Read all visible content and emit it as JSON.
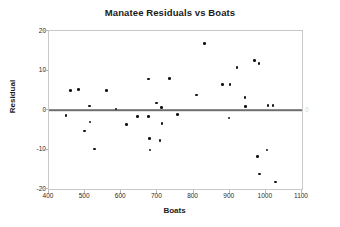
{
  "chart_data": {
    "type": "scatter",
    "title": "Manatee Residuals vs Boats",
    "xlabel": "Boats",
    "ylabel": "Residual",
    "xlim": [
      400,
      1100
    ],
    "ylim": [
      -20,
      20
    ],
    "xticks": [
      400,
      500,
      600,
      700,
      800,
      900,
      1000,
      1100
    ],
    "yticks": [
      20,
      10,
      0,
      -10,
      -20
    ],
    "grid": false,
    "legend": null,
    "reference_line": {
      "y": 0,
      "label": "0",
      "color": "#6e6e6e"
    },
    "series": [
      {
        "name": "Residuals",
        "marker": "filled-circle",
        "color": "#151515",
        "points": [
          {
            "x": 447,
            "y": -1.4
          },
          {
            "x": 460,
            "y": 5.0
          },
          {
            "x": 481,
            "y": 5.2
          },
          {
            "x": 498,
            "y": -5.3
          },
          {
            "x": 512,
            "y": 1.0
          },
          {
            "x": 513,
            "y": -3.0
          },
          {
            "x": 526,
            "y": -9.9
          },
          {
            "x": 559,
            "y": 4.9
          },
          {
            "x": 585,
            "y": 0.3
          },
          {
            "x": 614,
            "y": -3.6
          },
          {
            "x": 645,
            "y": -1.6
          },
          {
            "x": 675,
            "y": -1.6
          },
          {
            "x": 676,
            "y": 7.8
          },
          {
            "x": 678,
            "y": -7.2
          },
          {
            "x": 679,
            "y": -10.1
          },
          {
            "x": 698,
            "y": 1.8
          },
          {
            "x": 707,
            "y": -7.7
          },
          {
            "x": 711,
            "y": 0.6
          },
          {
            "x": 713,
            "y": -3.4
          },
          {
            "x": 733,
            "y": 8.0
          },
          {
            "x": 755,
            "y": -1.2
          },
          {
            "x": 808,
            "y": 3.8
          },
          {
            "x": 831,
            "y": 16.8
          },
          {
            "x": 880,
            "y": 6.4
          },
          {
            "x": 898,
            "y": -2.0
          },
          {
            "x": 901,
            "y": 6.5
          },
          {
            "x": 920,
            "y": 10.8
          },
          {
            "x": 942,
            "y": 3.1
          },
          {
            "x": 944,
            "y": 0.9
          },
          {
            "x": 968,
            "y": 12.5
          },
          {
            "x": 977,
            "y": -11.7
          },
          {
            "x": 981,
            "y": 11.8
          },
          {
            "x": 982,
            "y": -16.2
          },
          {
            "x": 1003,
            "y": -10.1
          },
          {
            "x": 1006,
            "y": 1.1
          },
          {
            "x": 1020,
            "y": 1.1
          },
          {
            "x": 1027,
            "y": -18.2
          }
        ]
      }
    ]
  }
}
